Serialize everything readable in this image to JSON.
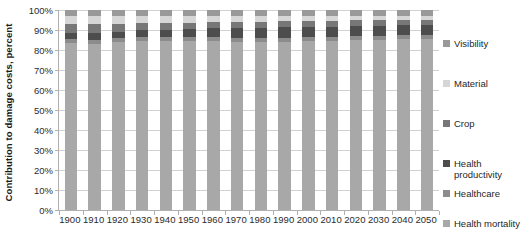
{
  "chart_data": {
    "type": "bar",
    "stacked": true,
    "stack_mode": "percent",
    "title": "",
    "subtitle": "",
    "xlabel": "",
    "ylabel": "Contribution to damage costs, percent",
    "ylim": [
      0,
      100
    ],
    "ytick_labels": [
      "0%",
      "10%",
      "20%",
      "30%",
      "40%",
      "50%",
      "60%",
      "70%",
      "80%",
      "90%",
      "100%"
    ],
    "ytick_values": [
      0,
      10,
      20,
      30,
      40,
      50,
      60,
      70,
      80,
      90,
      100
    ],
    "grid": true,
    "grid_axis": "y",
    "legend_position": "right",
    "categories": [
      "1900",
      "1910",
      "1920",
      "1930",
      "1940",
      "1950",
      "1960",
      "1970",
      "1980",
      "1990",
      "2000",
      "2010",
      "2020",
      "2030",
      "2040",
      "2050"
    ],
    "series": [
      {
        "name": "Health mortality",
        "color": "#a8a8a8",
        "values": [
          83.5,
          83.0,
          84.0,
          84.5,
          84.5,
          84.5,
          84.5,
          84.0,
          84.0,
          84.0,
          84.5,
          84.5,
          85.0,
          85.0,
          85.5,
          85.5
        ]
      },
      {
        "name": "Healthcare",
        "color": "#8c8c8c",
        "values": [
          2.0,
          2.0,
          2.0,
          2.0,
          2.0,
          2.0,
          2.0,
          2.0,
          2.0,
          2.0,
          2.0,
          2.0,
          2.0,
          2.0,
          2.0,
          2.0
        ]
      },
      {
        "name": "Health productivity",
        "color": "#4d4d4d",
        "values": [
          3.0,
          3.5,
          3.0,
          3.5,
          3.5,
          4.0,
          4.5,
          5.0,
          5.0,
          5.5,
          5.0,
          5.0,
          5.0,
          5.0,
          5.0,
          5.0
        ]
      },
      {
        "name": "Crop",
        "color": "#777777",
        "values": [
          4.5,
          4.5,
          4.0,
          3.5,
          3.5,
          3.0,
          3.0,
          3.0,
          3.0,
          3.0,
          3.0,
          3.0,
          3.0,
          3.0,
          2.5,
          2.5
        ]
      },
      {
        "name": "Material",
        "color": "#d6d6d6",
        "values": [
          4.0,
          4.0,
          4.0,
          3.5,
          3.5,
          3.5,
          3.0,
          3.0,
          3.0,
          2.5,
          2.5,
          2.5,
          2.0,
          2.0,
          2.0,
          2.0
        ]
      },
      {
        "name": "Visibility",
        "color": "#999999",
        "values": [
          3.0,
          3.0,
          3.0,
          3.0,
          3.0,
          3.0,
          3.0,
          3.0,
          3.0,
          3.0,
          3.0,
          3.0,
          3.0,
          3.0,
          3.0,
          3.0
        ]
      }
    ]
  },
  "legend": {
    "items": [
      {
        "label": "Visibility",
        "color": "#999999"
      },
      {
        "label": "Material",
        "color": "#d6d6d6"
      },
      {
        "label": "Crop",
        "color": "#777777"
      },
      {
        "label": "Health\nproductivity",
        "color": "#4d4d4d"
      },
      {
        "label": "Healthcare",
        "color": "#8c8c8c"
      },
      {
        "label": "Health mortality",
        "color": "#a8a8a8"
      }
    ]
  },
  "axes": {
    "y_title": "Contribution to damage costs, percent"
  },
  "colors": {
    "gridline": "#d2d2d2",
    "axis": "#b0b0b0",
    "text": "#2b2b2b",
    "background": "#ffffff"
  }
}
